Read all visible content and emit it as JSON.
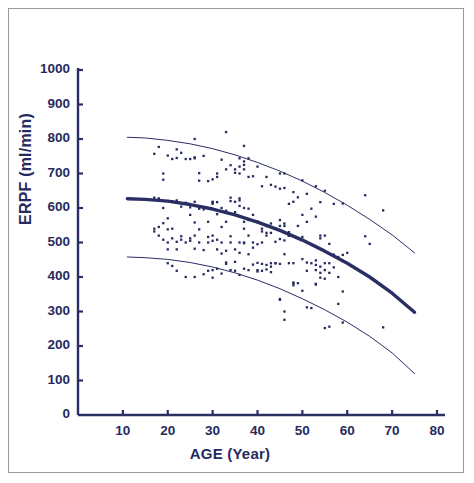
{
  "chart_data": {
    "type": "scatter",
    "title": "",
    "xlabel": "AGE (Year)",
    "ylabel": "ERPF (ml/min)",
    "xlim": [
      0,
      80
    ],
    "ylim": [
      0,
      1000
    ],
    "xticks": [
      10,
      20,
      30,
      40,
      50,
      60,
      70,
      80
    ],
    "yticks": [
      0,
      100,
      200,
      300,
      400,
      500,
      600,
      700,
      800,
      900,
      1000
    ],
    "grid": false,
    "legend": "none",
    "axis_color": "#2a2f63",
    "marker_color": "#262b5e",
    "curve_color": "#2a2f63",
    "marker": "square",
    "series": [
      {
        "name": "ERPF measurements",
        "points": [
          [
            17,
            757
          ],
          [
            18,
            777
          ],
          [
            19,
            700
          ],
          [
            19,
            682
          ],
          [
            20,
            752
          ],
          [
            21,
            742
          ],
          [
            22,
            745
          ],
          [
            22,
            770
          ],
          [
            23,
            760
          ],
          [
            24,
            742
          ],
          [
            25,
            742
          ],
          [
            26,
            800
          ],
          [
            26,
            744
          ],
          [
            26,
            747
          ],
          [
            27,
            701
          ],
          [
            27,
            679
          ],
          [
            28,
            751
          ],
          [
            29,
            678
          ],
          [
            30,
            683
          ],
          [
            31,
            700
          ],
          [
            31,
            690
          ],
          [
            32,
            740
          ],
          [
            33,
            820
          ],
          [
            33,
            712
          ],
          [
            34,
            724
          ],
          [
            35,
            712
          ],
          [
            35,
            702
          ],
          [
            36,
            744
          ],
          [
            36,
            720
          ],
          [
            36,
            700
          ],
          [
            37,
            735
          ],
          [
            37,
            725
          ],
          [
            37,
            712
          ],
          [
            37,
            780
          ],
          [
            38,
            744
          ],
          [
            38,
            690
          ],
          [
            39,
            692
          ],
          [
            40,
            720
          ],
          [
            41,
            663
          ],
          [
            42,
            690
          ],
          [
            43,
            667
          ],
          [
            44,
            662
          ],
          [
            45,
            700
          ],
          [
            45,
            656
          ],
          [
            46,
            700
          ],
          [
            46,
            658
          ],
          [
            47,
            612
          ],
          [
            48,
            646
          ],
          [
            49,
            631
          ],
          [
            50,
            680
          ],
          [
            51,
            641
          ],
          [
            53,
            663
          ],
          [
            54,
            617
          ],
          [
            55,
            650
          ],
          [
            57,
            612
          ],
          [
            59,
            613
          ],
          [
            64,
            637
          ],
          [
            68,
            593
          ],
          [
            17,
            630
          ],
          [
            18,
            628
          ],
          [
            19,
            600
          ],
          [
            19,
            556
          ],
          [
            20,
            570
          ],
          [
            20,
            538
          ],
          [
            21,
            540
          ],
          [
            21,
            620
          ],
          [
            22,
            622
          ],
          [
            22,
            618
          ],
          [
            22,
            616
          ],
          [
            23,
            604
          ],
          [
            24,
            615
          ],
          [
            25,
            602
          ],
          [
            25,
            580
          ],
          [
            26,
            618
          ],
          [
            26,
            558
          ],
          [
            27,
            598
          ],
          [
            27,
            538
          ],
          [
            28,
            596
          ],
          [
            29,
            560
          ],
          [
            30,
            617
          ],
          [
            30,
            612
          ],
          [
            30,
            618
          ],
          [
            31,
            617
          ],
          [
            31,
            582
          ],
          [
            32,
            600
          ],
          [
            32,
            545
          ],
          [
            33,
            592
          ],
          [
            33,
            560
          ],
          [
            34,
            630
          ],
          [
            34,
            620
          ],
          [
            35,
            618
          ],
          [
            35,
            588
          ],
          [
            36,
            622
          ],
          [
            36,
            628
          ],
          [
            36,
            606
          ],
          [
            37,
            600
          ],
          [
            37,
            560
          ],
          [
            37,
            540
          ],
          [
            38,
            598
          ],
          [
            38,
            565
          ],
          [
            39,
            580
          ],
          [
            40,
            560
          ],
          [
            40,
            560
          ],
          [
            41,
            540
          ],
          [
            41,
            532
          ],
          [
            42,
            548
          ],
          [
            42,
            528
          ],
          [
            43,
            555
          ],
          [
            43,
            528
          ],
          [
            44,
            540
          ],
          [
            45,
            565
          ],
          [
            45,
            548
          ],
          [
            46,
            555
          ],
          [
            46,
            548
          ],
          [
            47,
            530
          ],
          [
            47,
            520
          ],
          [
            48,
            618
          ],
          [
            49,
            548
          ],
          [
            50,
            580
          ],
          [
            51,
            560
          ],
          [
            52,
            598
          ],
          [
            53,
            575
          ],
          [
            54,
            520
          ],
          [
            54,
            512
          ],
          [
            55,
            520
          ],
          [
            56,
            496
          ],
          [
            57,
            465
          ],
          [
            58,
            458
          ],
          [
            59,
            447
          ],
          [
            60,
            470
          ],
          [
            64,
            518
          ],
          [
            65,
            496
          ],
          [
            17,
            540
          ],
          [
            17,
            532
          ],
          [
            18,
            520
          ],
          [
            18,
            545
          ],
          [
            19,
            508
          ],
          [
            20,
            500
          ],
          [
            20,
            480
          ],
          [
            21,
            512
          ],
          [
            22,
            502
          ],
          [
            22,
            480
          ],
          [
            23,
            518
          ],
          [
            23,
            508
          ],
          [
            24,
            500
          ],
          [
            25,
            512
          ],
          [
            25,
            505
          ],
          [
            26,
            520
          ],
          [
            26,
            482
          ],
          [
            27,
            500
          ],
          [
            28,
            478
          ],
          [
            29,
            516
          ],
          [
            29,
            500
          ],
          [
            30,
            520
          ],
          [
            30,
            505
          ],
          [
            31,
            508
          ],
          [
            31,
            480
          ],
          [
            32,
            468
          ],
          [
            32,
            500
          ],
          [
            33,
            476
          ],
          [
            33,
            442
          ],
          [
            34,
            518
          ],
          [
            34,
            500
          ],
          [
            35,
            480
          ],
          [
            35,
            444
          ],
          [
            36,
            500
          ],
          [
            36,
            470
          ],
          [
            37,
            498
          ],
          [
            37,
            500
          ],
          [
            38,
            520
          ],
          [
            38,
            466
          ],
          [
            39,
            500
          ],
          [
            39,
            485
          ],
          [
            40,
            495
          ],
          [
            40,
            441
          ],
          [
            41,
            438
          ],
          [
            41,
            500
          ],
          [
            42,
            520
          ],
          [
            42,
            435
          ],
          [
            43,
            430
          ],
          [
            43,
            414
          ],
          [
            44,
            502
          ],
          [
            44,
            440
          ],
          [
            45,
            438
          ],
          [
            45,
            510
          ],
          [
            46,
            506
          ],
          [
            46,
            466
          ],
          [
            47,
            520
          ],
          [
            47,
            440
          ],
          [
            48,
            440
          ],
          [
            48,
            384
          ],
          [
            49,
            382
          ],
          [
            50,
            516
          ],
          [
            50,
            452
          ],
          [
            51,
            442
          ],
          [
            51,
            418
          ],
          [
            52,
            440
          ],
          [
            53,
            420
          ],
          [
            53,
            435
          ],
          [
            53,
            448
          ],
          [
            54,
            430
          ],
          [
            54,
            412
          ],
          [
            54,
            398
          ],
          [
            55,
            440
          ],
          [
            55,
            420
          ],
          [
            55,
            395
          ],
          [
            56,
            440
          ],
          [
            56,
            412
          ],
          [
            57,
            428
          ],
          [
            58,
            400
          ],
          [
            59,
            464
          ],
          [
            59,
            358
          ],
          [
            20,
            440
          ],
          [
            21,
            432
          ],
          [
            22,
            418
          ],
          [
            24,
            400
          ],
          [
            26,
            400
          ],
          [
            28,
            408
          ],
          [
            29,
            418
          ],
          [
            30,
            420
          ],
          [
            30,
            398
          ],
          [
            31,
            424
          ],
          [
            32,
            410
          ],
          [
            33,
            438
          ],
          [
            34,
            420
          ],
          [
            35,
            418
          ],
          [
            36,
            406
          ],
          [
            37,
            424
          ],
          [
            38,
            420
          ],
          [
            39,
            436
          ],
          [
            40,
            420
          ],
          [
            40,
            416
          ],
          [
            41,
            418
          ],
          [
            42,
            422
          ],
          [
            43,
            440
          ],
          [
            44,
            440
          ],
          [
            45,
            336
          ],
          [
            45,
            334
          ],
          [
            46,
            300
          ],
          [
            46,
            276
          ],
          [
            48,
            382
          ],
          [
            48,
            376
          ],
          [
            50,
            360
          ],
          [
            51,
            312
          ],
          [
            52,
            310
          ],
          [
            53,
            380
          ],
          [
            53,
            378
          ],
          [
            55,
            252
          ],
          [
            56,
            256
          ],
          [
            58,
            322
          ],
          [
            59,
            268
          ],
          [
            68,
            254
          ]
        ]
      }
    ],
    "curves": [
      {
        "name": "upper confidence bound",
        "style": "thin",
        "x": [
          11,
          15,
          20,
          25,
          30,
          35,
          40,
          45,
          50,
          55,
          60,
          65,
          70,
          75
        ],
        "y": [
          805,
          803,
          796,
          786,
          772,
          754,
          732,
          707,
          678,
          645,
          608,
          567,
          522,
          470
        ]
      },
      {
        "name": "mean regression",
        "style": "thick",
        "x": [
          11,
          15,
          20,
          25,
          30,
          35,
          40,
          45,
          50,
          55,
          60,
          65,
          70,
          75
        ],
        "y": [
          627,
          625,
          620,
          610,
          597,
          580,
          559,
          535,
          507,
          475,
          440,
          400,
          353,
          298
        ]
      },
      {
        "name": "lower confidence bound",
        "style": "thin",
        "x": [
          11,
          15,
          20,
          25,
          30,
          35,
          40,
          45,
          50,
          55,
          60,
          65,
          70,
          75
        ],
        "y": [
          458,
          456,
          451,
          442,
          429,
          412,
          391,
          366,
          337,
          305,
          269,
          228,
          180,
          120
        ]
      }
    ]
  },
  "axes": {
    "ylabel": "ERPF (ml/min)",
    "xlabel": "AGE (Year)",
    "yticks": [
      "1000",
      "900",
      "800",
      "700",
      "600",
      "500",
      "400",
      "300",
      "200",
      "100",
      "0"
    ],
    "xticks": [
      "10",
      "20",
      "30",
      "40",
      "50",
      "60",
      "70",
      "80"
    ]
  }
}
